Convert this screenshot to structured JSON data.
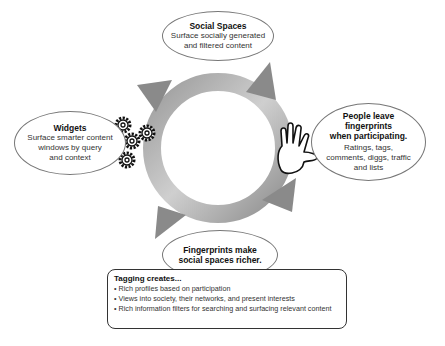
{
  "diagram": {
    "type": "cycle",
    "nodes": {
      "social_spaces": {
        "title": "Social Spaces",
        "desc_lines": [
          "Surface socially generated",
          "and filtered content"
        ]
      },
      "people": {
        "title_lines": [
          "People leave",
          "fingerprints",
          "when participating."
        ],
        "desc_lines": [
          "Ratings, tags,",
          "comments, diggs, traffic",
          "and lists"
        ],
        "icon": "hand-icon"
      },
      "fingerprints": {
        "title_lines": [
          "Fingerprints make",
          "social spaces richer."
        ]
      },
      "widgets": {
        "title": "Widgets",
        "desc_lines": [
          "Surface smarter content",
          "windows by query",
          "and context"
        ],
        "icon": "gears-icon"
      }
    },
    "ring_colors": {
      "arrow": "#8a8a8a",
      "band": "#c4c4c4"
    }
  },
  "tagging_box": {
    "heading": "Tagging creates...",
    "items": [
      "• Rich profiles based on participation",
      "• Views into society, their networks, and present interests",
      "• Rich information filters for searching and surfacing relevant content"
    ]
  }
}
